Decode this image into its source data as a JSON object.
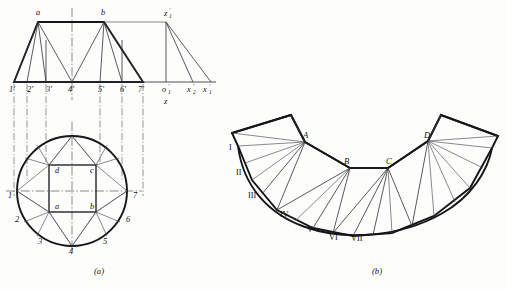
{
  "figure": {
    "captions": {
      "a": "(a)",
      "b": "(b)"
    }
  },
  "colors": {
    "background": "#fdfdfb",
    "outline": "#16161a",
    "thin_line": "#4a4a52",
    "centerline": "#55555d",
    "text": "#101014"
  },
  "view_a": {
    "name": "front-view-and-top-view",
    "front_view": {
      "top_labels": [
        {
          "text": "a",
          "x": 36,
          "y": 15
        },
        {
          "text": "b",
          "x": 101,
          "y": 15
        }
      ],
      "baseline_labels": [
        {
          "text": "1'",
          "x": 9,
          "y": 92
        },
        {
          "text": "2'",
          "x": 27,
          "y": 92
        },
        {
          "text": "3'",
          "x": 46,
          "y": 92
        },
        {
          "text": "4'",
          "x": 72,
          "y": 92
        },
        {
          "text": "5'",
          "x": 100,
          "y": 92
        },
        {
          "text": "6'",
          "x": 122,
          "y": 92
        },
        {
          "text": "7'",
          "x": 140,
          "y": 92
        }
      ]
    },
    "auxiliary": {
      "name": "true-length-diagram",
      "labels": [
        {
          "base": "z",
          "sup": "′",
          "sub": "1",
          "x": 168,
          "y": 16
        },
        {
          "base": "o",
          "sup": "′",
          "sub": "1",
          "x": 168,
          "y": 92
        },
        {
          "base": "x",
          "sup": "′",
          "sub": "2",
          "x": 193,
          "y": 92
        },
        {
          "base": "x",
          "sup": "′",
          "sub": "1",
          "x": 209,
          "y": 92
        },
        {
          "base": "z",
          "sup": "",
          "sub": "",
          "x": 168,
          "y": 104
        }
      ]
    },
    "top_view": {
      "name": "circle-and-square-plan",
      "square_labels": [
        {
          "text": "d",
          "x": 58,
          "y": 171
        },
        {
          "text": "c",
          "x": 97,
          "y": 171
        },
        {
          "text": "a",
          "x": 58,
          "y": 208
        },
        {
          "text": "b",
          "x": 97,
          "y": 208
        }
      ],
      "circle_labels": [
        {
          "text": "1",
          "x": 12,
          "y": 196
        },
        {
          "text": "2",
          "x": 19,
          "y": 219
        },
        {
          "text": "3",
          "x": 41,
          "y": 240
        },
        {
          "text": "4",
          "x": 71,
          "y": 248
        },
        {
          "text": "5",
          "x": 104,
          "y": 241
        },
        {
          "text": "6",
          "x": 126,
          "y": 219
        },
        {
          "text": "7",
          "x": 136,
          "y": 196
        }
      ]
    }
  },
  "view_b": {
    "name": "surface-development-pattern",
    "corner_labels": [
      {
        "text": "A",
        "x": 305,
        "y": 136
      },
      {
        "text": "B",
        "x": 345,
        "y": 164
      },
      {
        "text": "C",
        "x": 388,
        "y": 164
      },
      {
        "text": "D",
        "x": 425,
        "y": 136
      }
    ],
    "roman_labels": [
      {
        "text": "I",
        "x": 231,
        "y": 148
      },
      {
        "text": "II",
        "x": 240,
        "y": 173
      },
      {
        "text": "III",
        "x": 254,
        "y": 196
      },
      {
        "text": "IV",
        "x": 284,
        "y": 215
      },
      {
        "text": "V",
        "x": 310,
        "y": 230
      },
      {
        "text": "VI",
        "x": 333,
        "y": 237
      },
      {
        "text": "VII",
        "x": 356,
        "y": 238
      }
    ]
  }
}
